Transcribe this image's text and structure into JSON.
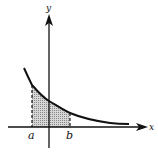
{
  "figure": {
    "axes": {
      "x_label": "x",
      "y_label": "y"
    },
    "markers": {
      "a_label": "a",
      "b_label": "b"
    },
    "colors": {
      "ink": "#111111",
      "shade": "#bdbdbd",
      "background": "#ffffff"
    }
  }
}
